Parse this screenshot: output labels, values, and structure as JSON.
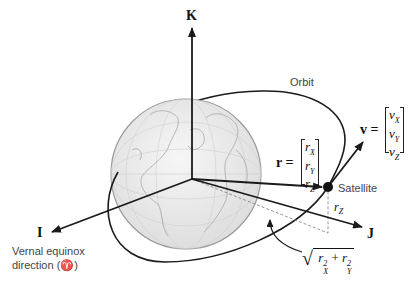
{
  "diagram": {
    "axes": {
      "k_label": "K",
      "i_label": "I",
      "j_label": "J"
    },
    "orbit_label": "Orbit",
    "satellite_label": "Satellite",
    "vernal_label_line1": "Vernal equinox",
    "vernal_label_line2": "direction (♈)",
    "position_vector": {
      "name": "r",
      "equals": "r =",
      "components": [
        "r",
        "r",
        "r"
      ],
      "subscripts": [
        "X",
        "Y",
        "Z"
      ]
    },
    "velocity_vector": {
      "name": "v",
      "equals": "v =",
      "components": [
        "v",
        "v",
        "v"
      ],
      "subscripts": [
        "X",
        "Y",
        "Z"
      ]
    },
    "rz_label": "r",
    "rz_sub": "Z",
    "sqrt_label": {
      "r1": "r",
      "r1_sub": "X",
      "r1_sup": "2",
      "plus": "+",
      "r2": "r",
      "r2_sub": "Y",
      "r2_sup": "2"
    },
    "colors": {
      "line": "#1a1a1a",
      "globe_fill": "#ececec",
      "globe_stroke": "#9a9a9a",
      "dashed": "#8a8a8a"
    }
  }
}
